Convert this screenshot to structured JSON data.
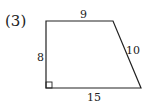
{
  "problem": {
    "label": "(3)"
  },
  "figure": {
    "shape": "right trapezoid",
    "sides": {
      "top": "9",
      "left": "8",
      "right_slant": "10",
      "bottom": "15"
    },
    "right_angle_marker": "bottom-left",
    "stroke_color": "#222222"
  }
}
